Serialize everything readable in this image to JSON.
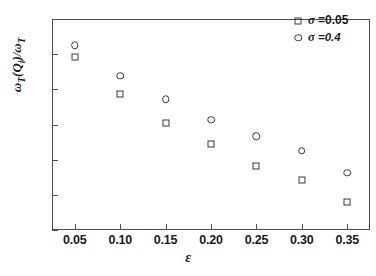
{
  "chart_data": {
    "type": "scatter",
    "title": "",
    "xlabel": "ε",
    "ylabel": "ωT(Qi)/ωT",
    "x": [
      0.05,
      0.1,
      0.15,
      0.2,
      0.25,
      0.3,
      0.35
    ],
    "xlim": [
      0.025,
      0.375
    ],
    "ylim": [
      0.1,
      0.7
    ],
    "xticks": [
      "0.05",
      "0.10",
      "0.15",
      "0.20",
      "0.25",
      "0.30",
      "0.35"
    ],
    "xtick_values": [
      0.05,
      0.1,
      0.15,
      0.2,
      0.25,
      0.3,
      0.35
    ],
    "yticks": [
      "0.7",
      "0.6",
      "0.5",
      "0.4",
      "0.3",
      "0.2",
      "0.1"
    ],
    "ytick_values": [
      0.7,
      0.6,
      0.5,
      0.4,
      0.3,
      0.2,
      0.1
    ],
    "grid": false,
    "legend_position": "top-right",
    "series": [
      {
        "name": "σ =0.05",
        "marker": "square",
        "color": "#3a3a3a",
        "values": [
          0.592,
          0.487,
          0.405,
          0.345,
          0.282,
          0.243,
          0.18
        ]
      },
      {
        "name": "σ =0.4",
        "marker": "circle",
        "color": "#3a3a3a",
        "values": [
          0.625,
          0.538,
          0.472,
          0.413,
          0.367,
          0.325,
          0.263
        ]
      }
    ]
  },
  "axes": {
    "ylabel_main": "ω",
    "ylabel_sub1": "T",
    "ylabel_mid": "(Q",
    "ylabel_sub2": "i",
    "ylabel_close": ")/ω",
    "ylabel_sub3": "T",
    "xlabel": "ε"
  },
  "legend": {
    "entries": [
      {
        "symbol": "square",
        "label": "σ =0.05"
      },
      {
        "symbol": "circle",
        "label": "σ =0.4"
      }
    ]
  },
  "caption": ""
}
